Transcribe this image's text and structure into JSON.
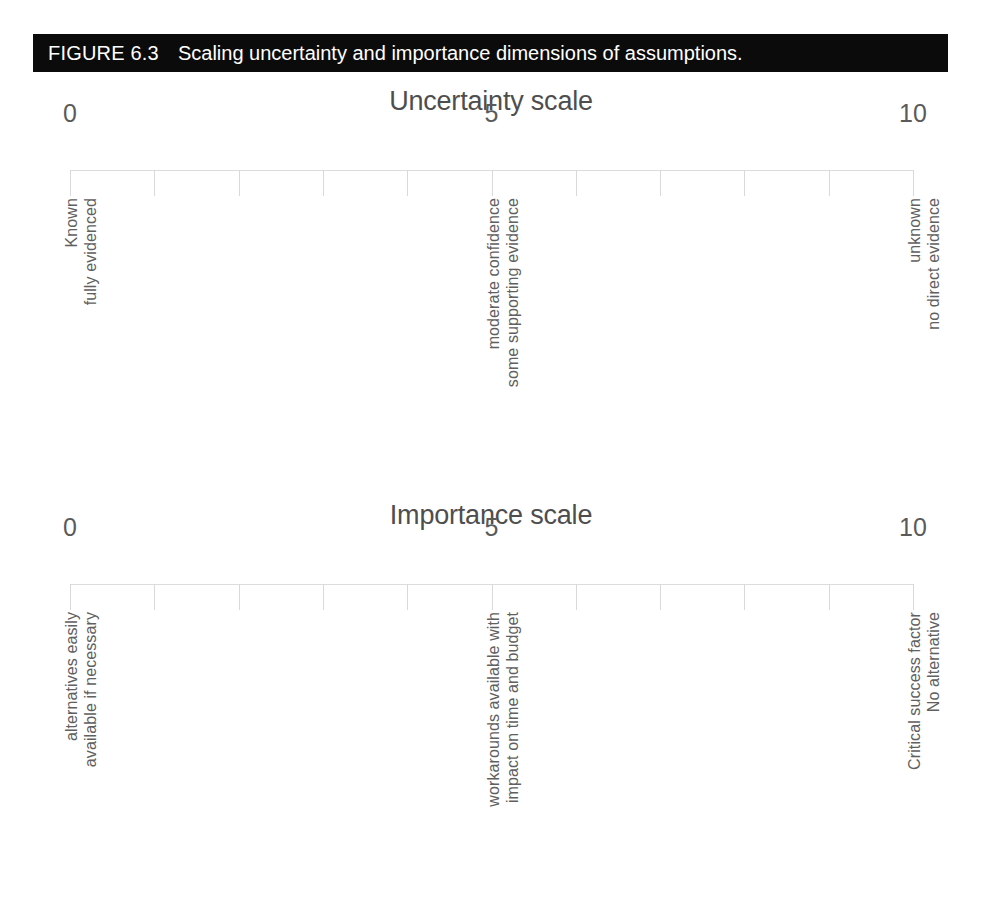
{
  "figure": {
    "label": "FIGURE 6.3",
    "caption": "Scaling uncertainty and importance dimensions of assumptions.",
    "bar_color": "#0b0b0b",
    "bar_text_color": "#ffffff"
  },
  "colors": {
    "title_text": "#4e4e4e",
    "tick_number_text": "#5a5a5a",
    "descriptor_text": "#606060",
    "axis_line": "#dcdcdc",
    "tick_mark": "#d9d9d9",
    "background": "#ffffff"
  },
  "chart_data": {
    "type": "table",
    "title": "Scaling uncertainty and importance dimensions of assumptions.",
    "scales": [
      {
        "id": "uncertainty",
        "title": "Uncertainty scale",
        "xlim": [
          0,
          10
        ],
        "tick_values": [
          0,
          1,
          2,
          3,
          4,
          5,
          6,
          7,
          8,
          9,
          10
        ],
        "labeled_ticks": [
          {
            "value": 0,
            "label": "0"
          },
          {
            "value": 5,
            "label": "5"
          },
          {
            "value": 10,
            "label": "10"
          }
        ],
        "anchors": [
          {
            "value": 0,
            "lines": [
              "Known",
              "fully evidenced"
            ]
          },
          {
            "value": 5,
            "lines": [
              "moderate confidence",
              "some supporting evidence"
            ]
          },
          {
            "value": 10,
            "lines": [
              "unknown",
              "no direct evidence"
            ]
          }
        ]
      },
      {
        "id": "importance",
        "title": "Importance scale",
        "xlim": [
          0,
          10
        ],
        "tick_values": [
          0,
          1,
          2,
          3,
          4,
          5,
          6,
          7,
          8,
          9,
          10
        ],
        "labeled_ticks": [
          {
            "value": 0,
            "label": "0"
          },
          {
            "value": 5,
            "label": "5"
          },
          {
            "value": 10,
            "label": "10"
          }
        ],
        "anchors": [
          {
            "value": 0,
            "lines": [
              "alternatives easily",
              "available if necessary"
            ]
          },
          {
            "value": 5,
            "lines": [
              "workarounds available with",
              "impact on time and budget"
            ]
          },
          {
            "value": 10,
            "lines": [
              "Critical success factor",
              "No alternative"
            ]
          }
        ]
      }
    ],
    "xlabel": "",
    "ylabel": "",
    "grid": false,
    "legend": "none"
  }
}
